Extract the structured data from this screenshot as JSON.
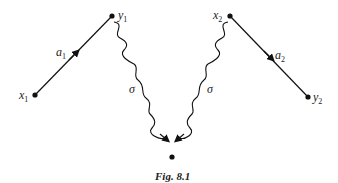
{
  "diagram": {
    "type": "feynman-like",
    "nodes": [
      {
        "id": "x1",
        "label": "x",
        "sub": "1",
        "x": 35,
        "y": 95
      },
      {
        "id": "y1",
        "label": "y",
        "sub": "1",
        "x": 112,
        "y": 16
      },
      {
        "id": "x2",
        "label": "x",
        "sub": "2",
        "x": 230,
        "y": 16
      },
      {
        "id": "y2",
        "label": "y",
        "sub": "2",
        "x": 308,
        "y": 97
      },
      {
        "id": "bottom",
        "label": "",
        "x": 172,
        "y": 157
      }
    ],
    "edges": [
      {
        "from": "x1",
        "to": "y1",
        "style": "straight-arrow",
        "label": "a",
        "sub": "1"
      },
      {
        "from": "x2",
        "to": "y2",
        "style": "straight-arrow",
        "label": "a",
        "sub": "2"
      },
      {
        "from": "y1",
        "to": "bottom",
        "style": "wavy-arrow",
        "label": "σ"
      },
      {
        "from": "x2",
        "to": "bottom",
        "style": "wavy-arrow",
        "label": "σ"
      }
    ],
    "caption": "Fig. 8.1"
  }
}
